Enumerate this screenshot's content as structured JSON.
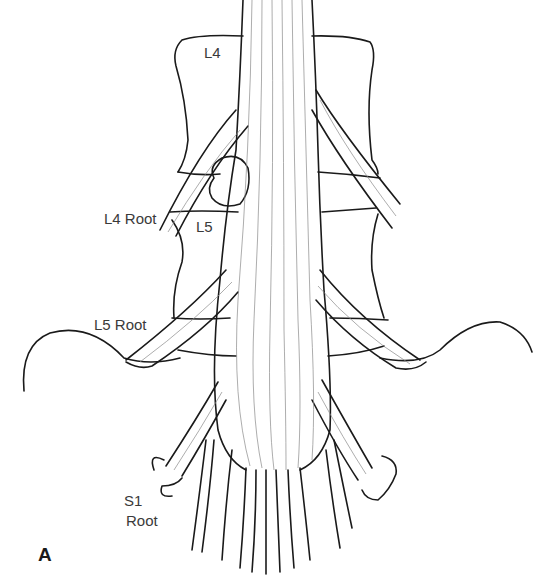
{
  "figure": {
    "panel_label": "A",
    "labels": {
      "l4_vertebra": "L4",
      "l5_vertebra": "L5",
      "l4_root": "L4 Root",
      "l5_root": "L5 Root",
      "s1_root_line1": "S1",
      "s1_root_line2": "Root"
    },
    "colors": {
      "ink": "#1a1a1a",
      "fiber": "#7a7a7a",
      "background": "#ffffff"
    }
  }
}
